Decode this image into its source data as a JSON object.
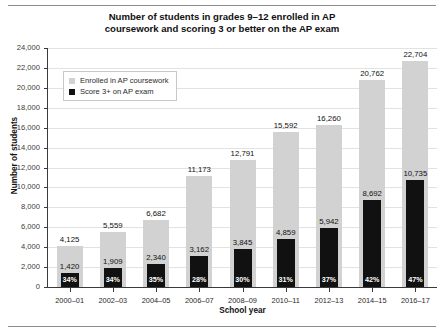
{
  "chart_data": {
    "type": "bar",
    "title": "Number of students in grades 9–12 enrolled in AP coursework and scoring 3 or better on the AP exam",
    "title_line1": "Number of students in grades 9–12 enrolled in AP",
    "title_line2": "coursework and scoring 3 or better on the AP exam",
    "xlabel": "School year",
    "ylabel": "Number of students",
    "ylim": [
      0,
      24000
    ],
    "ytick_step": 2000,
    "grid": true,
    "legend_position": "upper-left-inside",
    "categories": [
      "2000–01",
      "2002–03",
      "2004–05",
      "2006–07",
      "2008–09",
      "2010–11",
      "2012–13",
      "2014–15",
      "2016–17"
    ],
    "yticks": [
      "0",
      "2,000",
      "4,000",
      "6,000",
      "8,000",
      "10,000",
      "12,000",
      "14,000",
      "16,000",
      "18,000",
      "20,000",
      "22,000",
      "24,000"
    ],
    "ytick_values": [
      0,
      2000,
      4000,
      6000,
      8000,
      10000,
      12000,
      14000,
      16000,
      18000,
      20000,
      22000,
      24000
    ],
    "series": [
      {
        "name": "Enrolled in AP coursework",
        "color": "#d2d2d2",
        "values": [
          4125,
          5559,
          6682,
          11173,
          12791,
          15592,
          16260,
          20762,
          22704
        ],
        "labels": [
          "4,125",
          "5,559",
          "6,682",
          "11,173",
          "12,791",
          "15,592",
          "16,260",
          "20,762",
          "22,704"
        ]
      },
      {
        "name": "Score 3+ on AP exam",
        "color": "#111111",
        "values": [
          1420,
          1909,
          2340,
          3162,
          3845,
          4859,
          5942,
          8692,
          10735
        ],
        "labels": [
          "1,420",
          "1,909",
          "2,340",
          "3,162",
          "3,845",
          "4,859",
          "5,942",
          "8,692",
          "10,735"
        ],
        "percent_labels": [
          "34%",
          "34%",
          "35%",
          "28%",
          "30%",
          "31%",
          "37%",
          "42%",
          "47%"
        ]
      }
    ]
  }
}
